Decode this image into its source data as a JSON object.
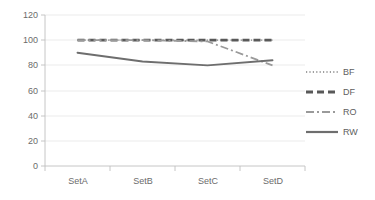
{
  "chart_data": {
    "type": "line",
    "title": "",
    "xlabel": "",
    "ylabel": "",
    "categories": [
      "SetA",
      "SetB",
      "SetC",
      "SetD"
    ],
    "yticks": [
      0,
      20,
      40,
      60,
      80,
      100,
      120
    ],
    "ylim": [
      0,
      120
    ],
    "grid": true,
    "legend_position": "right",
    "series": [
      {
        "name": "BF",
        "style": "dotted",
        "color": "#808080",
        "values": [
          100,
          100,
          100,
          100
        ]
      },
      {
        "name": "DF",
        "style": "dashed",
        "color": "#595959",
        "values": [
          100,
          100,
          100,
          100
        ]
      },
      {
        "name": "RO",
        "style": "dash-dot",
        "color": "#9a9a9a",
        "values": [
          100,
          100,
          99,
          80
        ]
      },
      {
        "name": "RW",
        "style": "solid",
        "color": "#6e6e6e",
        "values": [
          90,
          83,
          80,
          84
        ]
      }
    ]
  },
  "axis": {
    "y_labels": [
      "120",
      "100",
      "80",
      "60",
      "40",
      "20",
      "0"
    ],
    "x_labels": [
      "SetA",
      "SetB",
      "SetC",
      "SetD"
    ]
  },
  "legend": {
    "items": [
      {
        "label": "BF",
        "key": "dotted-line-key"
      },
      {
        "label": "DF",
        "key": "dashed-line-key"
      },
      {
        "label": "RO",
        "key": "dash-dot-line-key"
      },
      {
        "label": "RW",
        "key": "solid-line-key"
      }
    ]
  }
}
